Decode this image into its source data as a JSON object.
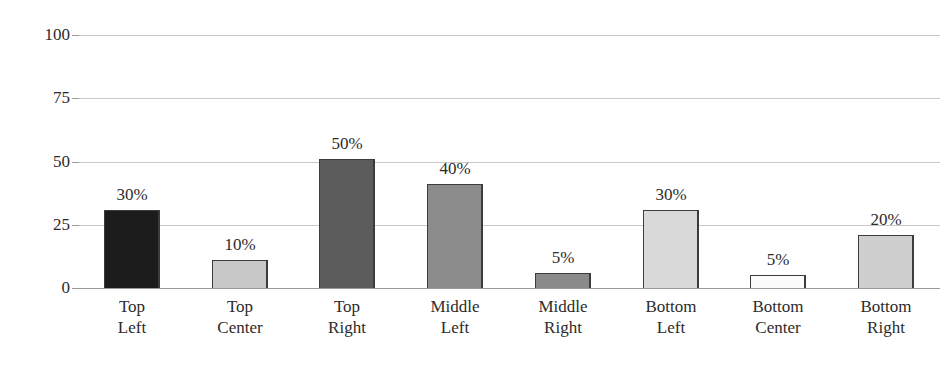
{
  "chart_data": {
    "type": "bar",
    "title": "",
    "subtitle": "",
    "xlabel": "",
    "ylabel": "",
    "categories": [
      "Top Left",
      "Top Center",
      "Top Right",
      "Middle Left",
      "Middle Right",
      "Bottom Left",
      "Bottom Center",
      "Bottom Right"
    ],
    "category_lines": [
      [
        "Top",
        "Left"
      ],
      [
        "Top",
        "Center"
      ],
      [
        "Top",
        "Right"
      ],
      [
        "Middle",
        "Left"
      ],
      [
        "Middle",
        "Right"
      ],
      [
        "Bottom",
        "Left"
      ],
      [
        "Bottom",
        "Center"
      ],
      [
        "Bottom",
        "Right"
      ]
    ],
    "values": [
      31,
      11,
      51,
      41,
      6,
      31,
      5,
      21
    ],
    "data_labels": [
      "30%",
      "10%",
      "50%",
      "40%",
      "5%",
      "30%",
      "5%",
      "20%"
    ],
    "bar_colors": [
      "#1c1c1c",
      "#c8c8c8",
      "#5c5c5c",
      "#8c8c8c",
      "#8a8a8a",
      "#d9d9d9",
      "#fbfbfb",
      "#cfcfcf"
    ],
    "bar_border_color": "#3c3c3c",
    "ylim": [
      0,
      100
    ],
    "ytick_labels": [
      "0",
      "25",
      "50",
      "75",
      "100"
    ],
    "ytick_values": [
      0,
      25,
      50,
      75,
      100
    ],
    "grid": true,
    "grid_color": "#c9c9c9",
    "axis_color": "#9a9a9a",
    "legend": false,
    "legend_position": "none",
    "text_color": "#2b2b2b",
    "background_color": "#ffffff"
  }
}
